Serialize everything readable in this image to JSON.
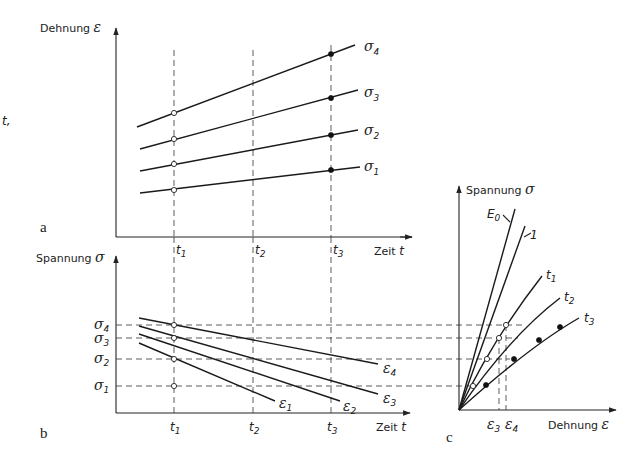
{
  "margin_text": "t,",
  "panel_a": {
    "letter": "a",
    "y_axis_label": "Dehnung",
    "y_axis_symbol": "ε",
    "x_axis_label": "Zeit",
    "x_axis_symbol": "t",
    "time_marks": [
      {
        "label": "t",
        "sub": "1"
      },
      {
        "label": "t",
        "sub": "2"
      },
      {
        "label": "t",
        "sub": "3"
      }
    ],
    "curves": [
      {
        "label": "σ",
        "sub": "4"
      },
      {
        "label": "σ",
        "sub": "3"
      },
      {
        "label": "σ",
        "sub": "2"
      },
      {
        "label": "σ",
        "sub": "1"
      }
    ]
  },
  "panel_b": {
    "letter": "b",
    "y_axis_label": "Spannung",
    "y_axis_symbol": "σ",
    "x_axis_label": "Zeit",
    "x_axis_symbol": "t",
    "time_marks": [
      {
        "label": "t",
        "sub": "1"
      },
      {
        "label": "t",
        "sub": "2"
      },
      {
        "label": "t",
        "sub": "3"
      }
    ],
    "stress_levels": [
      {
        "label": "σ",
        "sub": "4"
      },
      {
        "label": "σ",
        "sub": "3"
      },
      {
        "label": "σ",
        "sub": "2"
      },
      {
        "label": "σ",
        "sub": "1"
      }
    ],
    "curves": [
      {
        "label": "ε",
        "sub": "4"
      },
      {
        "label": "ε",
        "sub": "3"
      },
      {
        "label": "ε",
        "sub": "2"
      },
      {
        "label": "ε",
        "sub": "1"
      }
    ]
  },
  "panel_c": {
    "letter": "c",
    "y_axis_label": "Spannung",
    "y_axis_symbol": "σ",
    "x_axis_label": "Dehnung",
    "x_axis_symbol": "ε",
    "curves": [
      {
        "label": "E",
        "sub": "0"
      },
      {
        "label": "1",
        "sub": ""
      },
      {
        "label": "t",
        "sub": "1"
      },
      {
        "label": "t",
        "sub": "2"
      },
      {
        "label": "t",
        "sub": "3"
      }
    ],
    "strain_marks": [
      {
        "label": "ε",
        "sub": "3"
      },
      {
        "label": "ε",
        "sub": "4"
      }
    ]
  }
}
